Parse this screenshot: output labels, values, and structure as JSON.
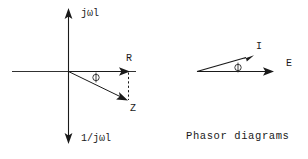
{
  "figure": {
    "caption": "Phasor diagrams",
    "impedance_diagram": {
      "name": "impedance-triangle",
      "axis_up_label": "jωl",
      "axis_down_label": "1/jωl",
      "resistance_label": "R",
      "impedance_label": "Z",
      "angle_label": "ϕ"
    },
    "phasor_diagram": {
      "name": "current-voltage-phasor",
      "current_label": "I",
      "voltage_label": "E",
      "angle_label": "ϕ"
    },
    "colors": {
      "ink": "#1a1a1a",
      "background": "#ffffff"
    }
  }
}
